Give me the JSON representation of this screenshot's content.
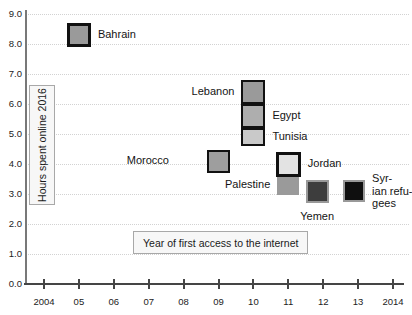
{
  "chart_data": {
    "type": "scatter",
    "title": "",
    "xlabel": "Year of first access to the internet",
    "ylabel": "Hours spent online 2016",
    "x_ticks": [
      "2004",
      "05",
      "06",
      "07",
      "08",
      "09",
      "10",
      "11",
      "12",
      "13",
      "2014"
    ],
    "y_ticks": [
      "9.0",
      "8.0",
      "7.0",
      "6.0",
      "5.0",
      "4.0",
      "3.0",
      "2.0",
      "1.0",
      "0.0"
    ],
    "xlim": [
      2003.5,
      2014.3
    ],
    "ylim": [
      0,
      9
    ],
    "grid": "horizontal-dotted",
    "legend": "none",
    "points": [
      {
        "label": "Bahrain",
        "x": 2005,
        "y": 8.3,
        "fill": "#9a9a9a",
        "border": "#111111",
        "border_w": 3.5,
        "size": 24,
        "label_position": "right"
      },
      {
        "label": "Lebanon",
        "x": 2010,
        "y": 6.4,
        "fill": "#9a9a9a",
        "border": "#111111",
        "border_w": 2.5,
        "size": 24,
        "label_position": "left"
      },
      {
        "label": "Egypt",
        "x": 2010,
        "y": 5.6,
        "fill": "#aeaeae",
        "border": "#111111",
        "border_w": 2.5,
        "size": 24,
        "label_position": "right"
      },
      {
        "label": "Tunisia",
        "x": 2010,
        "y": 4.9,
        "fill": "#c9c9c9",
        "border": "#111111",
        "border_w": 2.5,
        "size": 24,
        "h": 18,
        "label_position": "right"
      },
      {
        "label": "Morocco",
        "x": 2009,
        "y": 4.1,
        "fill": "#9e9e9e",
        "border": "#111111",
        "border_w": 2.5,
        "size": 23,
        "label_position": "left",
        "label_dx": -31
      },
      {
        "label": "Palestine",
        "x": 2011,
        "y": 3.3,
        "fill": "#9a9a9a",
        "border": null,
        "border_w": 0,
        "size": 22,
        "h": 19,
        "label_position": "left"
      },
      {
        "label": "Jordan",
        "x": 2011,
        "y": 4.0,
        "fill": "#e3e3e3",
        "border": "#111111",
        "border_w": 3.5,
        "size": 25,
        "label_position": "right"
      },
      {
        "label": "Yemen",
        "x": 2012,
        "y": 3.1,
        "fill": "#3d3d3d",
        "border": "#999999",
        "border_w": 2,
        "size": 23,
        "dx": -6,
        "label_position": "below"
      },
      {
        "label": "Syrian refugees",
        "x": 2013,
        "y": 3.1,
        "fill": "#0f0f0f",
        "border": "#999999",
        "border_w": 2,
        "size": 22,
        "dx": -4,
        "label_position": "right",
        "label_lines": [
          "Syr-",
          "ian refu-",
          "gees"
        ]
      }
    ]
  }
}
